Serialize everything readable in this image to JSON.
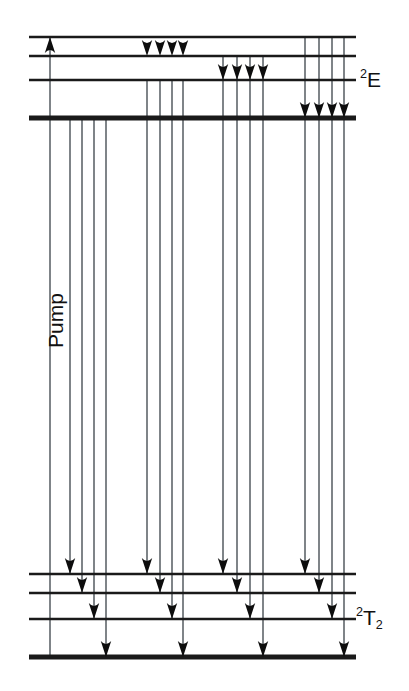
{
  "figure": {
    "type": "energy-level-diagram",
    "title": "",
    "width": 409,
    "height": 691,
    "background_color": "#ffffff",
    "line_color": "#1a1a1a",
    "transition_color": "#555b60",
    "arrow_color": "#0d0d0d"
  },
  "labels": {
    "upper_manifold": {
      "text": "2E",
      "superscript": "2",
      "base": "E",
      "x": 360,
      "y": 68
    },
    "lower_manifold": {
      "text": "2T2",
      "superscript": "2",
      "base": "T",
      "subscript": "2",
      "x": 356,
      "y": 606
    },
    "pump": {
      "text": "Pump",
      "rotation_deg": -90,
      "center_x": 38,
      "center_y": 337
    }
  },
  "geometry": {
    "line_start_x": 29,
    "line_end_x": 356,
    "upper_levels": [
      {
        "id": "E4",
        "y": 37,
        "weight": "thin"
      },
      {
        "id": "E3",
        "y": 56,
        "weight": "thin"
      },
      {
        "id": "E2",
        "y": 80,
        "weight": "thin"
      },
      {
        "id": "E1",
        "y": 118,
        "weight": "thick"
      }
    ],
    "lower_levels": [
      {
        "id": "T4",
        "y": 574,
        "weight": "thin"
      },
      {
        "id": "T3",
        "y": 593,
        "weight": "thin"
      },
      {
        "id": "T2",
        "y": 619,
        "weight": "thin"
      },
      {
        "id": "T1",
        "y": 657,
        "weight": "thick"
      }
    ]
  },
  "pump_transition": {
    "name": "pump-arrow",
    "x": 50,
    "from_y": 657,
    "to_y": 37,
    "direction": "up"
  },
  "emission_groups": [
    {
      "group": 1,
      "origin_level": "E1",
      "origin_y": 118,
      "lines": [
        {
          "x": 70,
          "to_y": 574
        },
        {
          "x": 82,
          "to_y": 593
        },
        {
          "x": 94,
          "to_y": 619
        },
        {
          "x": 106,
          "to_y": 657
        }
      ]
    },
    {
      "group": 2,
      "origin_level": "E2",
      "origin_y": 80,
      "lines": [
        {
          "x": 147,
          "to_y": 574
        },
        {
          "x": 160,
          "to_y": 593
        },
        {
          "x": 172,
          "to_y": 619
        },
        {
          "x": 183,
          "to_y": 657
        }
      ]
    },
    {
      "group": 3,
      "origin_level": "E3",
      "origin_y": 56,
      "lines": [
        {
          "x": 223,
          "to_y": 574
        },
        {
          "x": 237,
          "to_y": 593
        },
        {
          "x": 250,
          "to_y": 619
        },
        {
          "x": 263,
          "to_y": 657
        }
      ]
    },
    {
      "group": 4,
      "origin_level": "E4",
      "origin_y": 37,
      "lines": [
        {
          "x": 305,
          "to_y": 574
        },
        {
          "x": 319,
          "to_y": 593
        },
        {
          "x": 332,
          "to_y": 619
        },
        {
          "x": 344,
          "to_y": 657
        }
      ]
    }
  ],
  "relaxation_groups": [
    {
      "group": 1,
      "target_level": "E3",
      "target_y": 56,
      "arrow_xs": [
        147,
        160,
        172,
        183
      ],
      "from_y": 37
    },
    {
      "group": 2,
      "target_level": "E2",
      "target_y": 80,
      "arrow_xs": [
        223,
        237,
        250,
        263
      ],
      "from_y": 37
    },
    {
      "group": 3,
      "target_level": "E1",
      "target_y": 118,
      "arrow_xs": [
        305,
        319,
        332,
        344
      ],
      "from_y": 37
    }
  ]
}
